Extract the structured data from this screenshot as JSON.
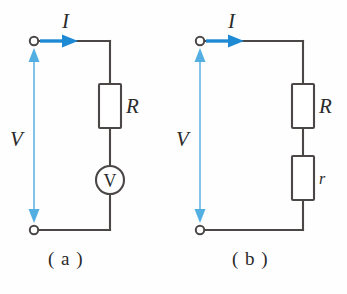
{
  "figure": {
    "background_color": "#fefefe",
    "wire_color": "#4a4746",
    "current_arrow_color": "#1f8ad4",
    "voltage_arrow_color": "#7cc0e8",
    "label_color": "#2b2b2b"
  },
  "panels": [
    {
      "id": "a",
      "caption": "( a )",
      "current_label": "I",
      "voltage_label": "V",
      "components": [
        {
          "type": "resistor",
          "label": "R"
        },
        {
          "type": "voltmeter",
          "label": "V"
        }
      ],
      "terminals": [
        {
          "name": "top-terminal"
        },
        {
          "name": "bottom-terminal"
        }
      ]
    },
    {
      "id": "b",
      "caption": "( b )",
      "current_label": "I",
      "voltage_label": "V",
      "components": [
        {
          "type": "resistor",
          "label": "R"
        },
        {
          "type": "resistor",
          "label": "r"
        }
      ],
      "terminals": [
        {
          "name": "top-terminal"
        },
        {
          "name": "bottom-terminal"
        }
      ]
    }
  ]
}
